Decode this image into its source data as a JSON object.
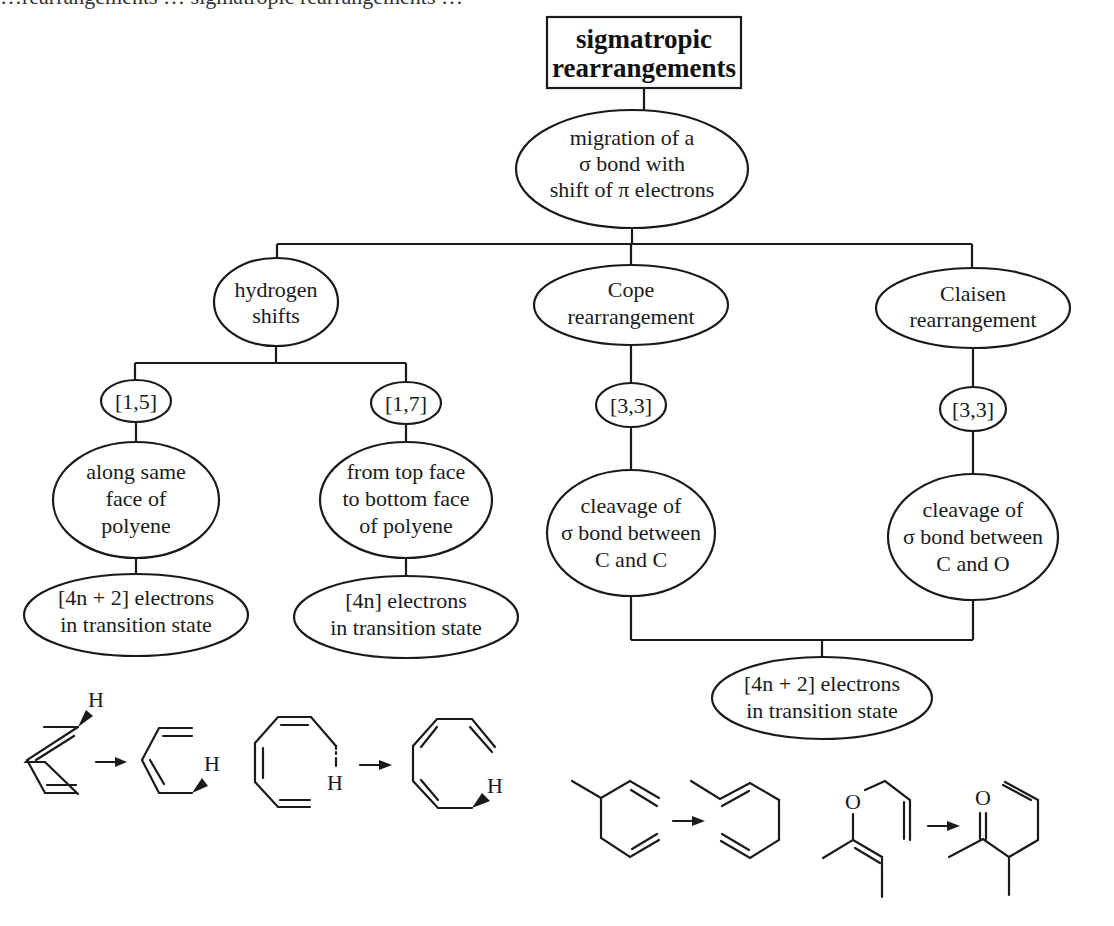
{
  "header": {
    "top_strip_partial_text": "…rearrangements … sigmatropic rearrangements …"
  },
  "title": {
    "line1": "sigmatropic",
    "line2": "rearrangements"
  },
  "root": {
    "lines": [
      "migration of a",
      "σ bond with",
      "shift of π electrons"
    ]
  },
  "branches": {
    "hydrogen": {
      "lines": [
        "hydrogen",
        "shifts"
      ],
      "children": [
        {
          "order": "[1,5]",
          "mode_lines": [
            "along same",
            "face of",
            "polyene"
          ],
          "electrons_lines": [
            "[4n + 2] electrons",
            "in transition state"
          ]
        },
        {
          "order": "[1,7]",
          "mode_lines": [
            "from top face",
            "to bottom face",
            "of polyene"
          ],
          "electrons_lines": [
            "[4n] electrons",
            "in transition state"
          ]
        }
      ]
    },
    "cope": {
      "lines": [
        "Cope",
        "rearrangement"
      ],
      "order": "[3,3]",
      "cleavage_lines": [
        "cleavage of",
        "σ bond between",
        "C and C"
      ]
    },
    "claisen": {
      "lines": [
        "Claisen",
        "rearrangement"
      ],
      "order": "[3,3]",
      "cleavage_lines": [
        "cleavage of",
        "σ bond between",
        "C and O"
      ]
    },
    "shared": {
      "electrons_lines": [
        "[4n + 2] electrons",
        "in transition state"
      ]
    }
  },
  "structures": {
    "h15": {
      "h_label": "H"
    },
    "h17": {
      "h_label": "H"
    },
    "claisen": {
      "o_label": "O"
    }
  }
}
